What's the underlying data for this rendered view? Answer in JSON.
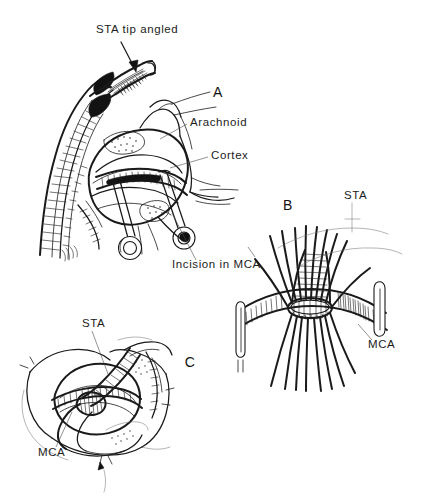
{
  "figure": {
    "background_color": "#ffffff",
    "ink_color": "#1a1a1a",
    "width": 422,
    "height": 500
  },
  "panels": [
    {
      "id": "A",
      "letter": "A",
      "letter_x": 218,
      "letter_y": 97,
      "description": "Superficial temporal artery with angled tip positioned over arachnoid-opened cortex; two ring-handled micro clamps retract the middle cerebral artery incision",
      "labels": [
        {
          "name": "sta-tip-angled",
          "text": "STA tip angled",
          "x": 96,
          "y": 33,
          "anchor": "start"
        },
        {
          "name": "arachnoid",
          "text": "Arachnoid",
          "x": 190,
          "y": 126,
          "anchor": "start"
        },
        {
          "name": "cortex",
          "text": "Cortex",
          "x": 211,
          "y": 159,
          "anchor": "start"
        },
        {
          "name": "incision-in-mca",
          "text": "Incision in MCA",
          "x": 172,
          "y": 268,
          "anchor": "start"
        }
      ]
    },
    {
      "id": "B",
      "letter": "B",
      "letter_x": 288,
      "letter_y": 210,
      "description": "Close-up of the completed anastomosis with radiating interrupted sutures around the arteriotomy and vessel clips on either side",
      "labels": [
        {
          "name": "sta",
          "text": "STA",
          "x": 344,
          "y": 199,
          "anchor": "start"
        },
        {
          "name": "mca",
          "text": "MCA",
          "x": 368,
          "y": 348,
          "anchor": "start"
        }
      ]
    },
    {
      "id": "C",
      "letter": "C",
      "letter_x": 190,
      "letter_y": 367,
      "description": "Completed STA-MCA bypass seen through the craniotomy with the donor vessel lying across the recipient artery",
      "labels": [
        {
          "name": "sta",
          "text": "STA",
          "x": 82,
          "y": 327,
          "anchor": "start"
        },
        {
          "name": "mca",
          "text": "MCA",
          "x": 38,
          "y": 456,
          "anchor": "start"
        }
      ]
    }
  ]
}
